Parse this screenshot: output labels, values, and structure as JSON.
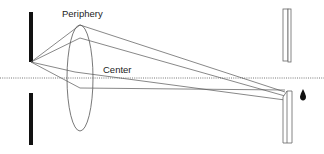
{
  "diagram": {
    "labels": {
      "periphery": "Periphery",
      "center": "Center"
    },
    "colors": {
      "line": "#555555",
      "aperture": "#111111",
      "axis": "#777777",
      "droplet": "#111111"
    },
    "elements": [
      "aperture-top",
      "aperture-bottom",
      "lens",
      "optical-axis",
      "upper-plate",
      "lower-plate",
      "droplet"
    ]
  }
}
